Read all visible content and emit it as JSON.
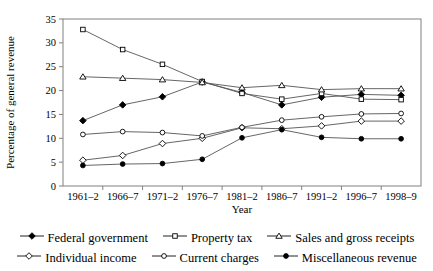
{
  "chart_data": {
    "type": "line",
    "title": "",
    "xlabel": "Year",
    "ylabel": "Percentage of general revenue",
    "categories": [
      "1961–2",
      "1966–7",
      "1971–2",
      "1976–7",
      "1981–2",
      "1986–7",
      "1991–2",
      "1996–7",
      "1998–9"
    ],
    "ylim": [
      0,
      35
    ],
    "yticks": [
      0,
      5,
      10,
      15,
      20,
      25,
      30,
      35
    ],
    "ytick_labels": [
      "0",
      "5",
      "10",
      "15",
      "20",
      "25",
      "30",
      "35"
    ],
    "grid": false,
    "legend_position": "below",
    "series": [
      {
        "name": "Federal government",
        "marker": "filled-diamond",
        "values": [
          13.7,
          17.0,
          18.7,
          21.8,
          19.6,
          17.0,
          18.6,
          19.2,
          19.0
        ]
      },
      {
        "name": "Property tax",
        "marker": "open-square",
        "values": [
          32.8,
          28.6,
          25.5,
          21.9,
          19.4,
          18.2,
          19.4,
          18.2,
          18.1
        ]
      },
      {
        "name": "Sales and gross receipts",
        "marker": "open-triangle",
        "values": [
          22.9,
          22.6,
          22.3,
          21.7,
          20.6,
          21.1,
          20.2,
          20.4,
          20.4
        ]
      },
      {
        "name": "Individual income",
        "marker": "open-diamond",
        "values": [
          5.4,
          6.4,
          8.9,
          10.0,
          12.2,
          12.0,
          12.6,
          13.6,
          13.6
        ]
      },
      {
        "name": "Current charges",
        "marker": "open-circle",
        "values": [
          10.8,
          11.4,
          11.2,
          10.5,
          12.3,
          13.8,
          14.5,
          15.1,
          15.2
        ]
      },
      {
        "name": "Miscellaneous revenue",
        "marker": "filled-circle",
        "values": [
          4.3,
          4.6,
          4.7,
          5.6,
          10.1,
          11.8,
          10.2,
          9.9,
          9.9
        ]
      }
    ]
  },
  "axes": {
    "x_title": "Year",
    "y_title": "Percentage of general revenue"
  },
  "legend": {
    "rows": [
      [
        {
          "label": "Federal government",
          "marker": "filled-diamond"
        },
        {
          "label": "Property tax",
          "marker": "open-square"
        },
        {
          "label": "Sales and gross receipts",
          "marker": "open-triangle"
        }
      ],
      [
        {
          "label": "Individual income",
          "marker": "open-diamond"
        },
        {
          "label": "Current charges",
          "marker": "open-circle"
        },
        {
          "label": "Miscellaneous revenue",
          "marker": "filled-circle"
        }
      ]
    ]
  },
  "style": {
    "line_color": "#555555",
    "axis_color": "#808080",
    "marker_stroke": "#000000",
    "marker_fill_open": "#ffffff",
    "marker_fill_solid": "#000000"
  }
}
